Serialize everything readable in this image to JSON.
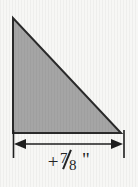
{
  "figure": {
    "kind": "technical-drawing",
    "background_color": "#f7f7f5",
    "shape": {
      "name": "right-triangle",
      "fill_color": "#a5a5a5",
      "stroke_color": "#2a2a2a",
      "stroke_width": 2,
      "right_angle_corner": "bottom-left",
      "vertices": [
        {
          "label": "top-left",
          "x": 13,
          "y": 18
        },
        {
          "label": "bottom-left",
          "x": 13,
          "y": 133
        },
        {
          "label": "bottom-right",
          "x": 121,
          "y": 133
        }
      ]
    },
    "dimension": {
      "name": "width-dimension",
      "orientation": "horizontal",
      "line_y": 144,
      "line_x_start": 14,
      "line_x_end": 123,
      "arrowheads": "both-ends-outward",
      "stroke_color": "#1f1f1f",
      "extension_lines": [
        {
          "label": "left-extension-line",
          "x": 13,
          "y_start": 130,
          "y_end": 158
        },
        {
          "label": "right-extension-line",
          "x": 124,
          "y_start": 130,
          "y_end": 158
        }
      ],
      "label": {
        "full_text": "+ 7/8\"",
        "sign": "+",
        "numerator": "7",
        "denominator": "8",
        "unit_symbol": "\"",
        "unit_name": "inches",
        "text_color": "#242424"
      }
    }
  }
}
